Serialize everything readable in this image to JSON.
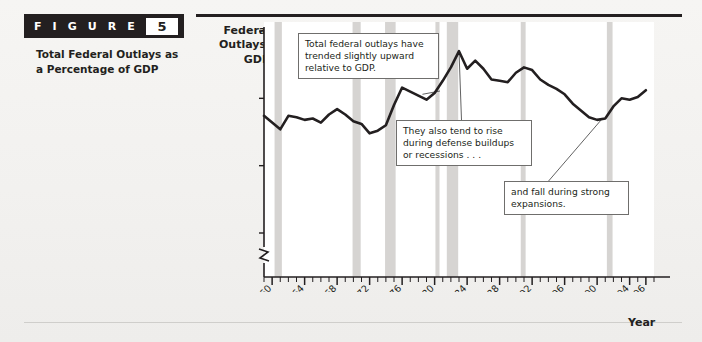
{
  "figure": {
    "tag_word": "F I G U R E",
    "number": "5",
    "caption": "Total Federal Outlays as a Percentage of GDP"
  },
  "axes": {
    "y_title": "Federal Outlays/ GDP",
    "x_title": "Year"
  },
  "callouts": {
    "c1": "Total federal outlays have trended slightly upward relative to GDP.",
    "c2": "They also tend to rise during defense buildups or recessions . . .",
    "c3": "and fall during strong expansions."
  },
  "colors": {
    "line": "#231f20",
    "recession_band": "#d6d4d2",
    "plot_bg": "#ffffff",
    "axis": "#231f20",
    "header_bar": "#231f20",
    "page_bg": "#f2f1ef"
  },
  "chart_data": {
    "type": "line",
    "title": "Total Federal Outlays as a Percentage of GDP",
    "xlabel": "Year",
    "ylabel": "Federal Outlays/GDP",
    "xlim": [
      1959,
      2007
    ],
    "ylim": [
      8.5,
      25
    ],
    "y_axis_break": true,
    "grid": false,
    "legend": false,
    "y_ticks": [
      10,
      15,
      20,
      25
    ],
    "y_tick_labels": [
      "10%",
      "15%",
      "20%",
      "25%"
    ],
    "x_ticks": [
      1960,
      1964,
      1968,
      1972,
      1976,
      1980,
      1984,
      1988,
      1992,
      1996,
      2000,
      2004,
      2006
    ],
    "x_tick_labels": [
      "1960",
      "1964",
      "1968",
      "1972",
      "1976",
      "1980",
      "1984",
      "1988",
      "1992",
      "1996",
      "2000",
      "2004",
      "2006"
    ],
    "x_minor_tick_interval": 1,
    "x": [
      1959,
      1960,
      1961,
      1962,
      1963,
      1964,
      1965,
      1966,
      1967,
      1968,
      1969,
      1970,
      1971,
      1972,
      1973,
      1974,
      1975,
      1976,
      1977,
      1978,
      1979,
      1980,
      1981,
      1982,
      1983,
      1984,
      1985,
      1986,
      1987,
      1988,
      1989,
      1990,
      1991,
      1992,
      1993,
      1994,
      1995,
      1996,
      1997,
      1998,
      1999,
      2000,
      2001,
      2002,
      2003,
      2004,
      2005,
      2006
    ],
    "values": [
      18.7,
      18.2,
      17.7,
      18.7,
      18.6,
      18.4,
      18.5,
      18.2,
      18.8,
      19.2,
      18.8,
      18.3,
      18.1,
      17.4,
      17.6,
      18.0,
      19.5,
      20.8,
      20.5,
      20.2,
      19.9,
      20.4,
      21.3,
      22.3,
      23.5,
      22.2,
      22.8,
      22.2,
      21.4,
      21.3,
      21.2,
      21.9,
      22.3,
      22.1,
      21.4,
      21.0,
      20.7,
      20.3,
      19.6,
      19.1,
      18.6,
      18.4,
      18.5,
      19.4,
      20.0,
      19.9,
      20.1,
      20.6
    ],
    "recession_bands": [
      {
        "start": 1960.3,
        "end": 1961.2
      },
      {
        "start": 1969.9,
        "end": 1970.9
      },
      {
        "start": 1973.9,
        "end": 1975.2
      },
      {
        "start": 1980.1,
        "end": 1980.6
      },
      {
        "start": 1981.5,
        "end": 1982.9
      },
      {
        "start": 1990.6,
        "end": 1991.2
      },
      {
        "start": 2001.2,
        "end": 2001.9
      }
    ],
    "annotations": [
      {
        "text": "Total federal outlays have trended slightly upward relative to GDP.",
        "leader_to": {
          "x": 1978.5,
          "y": 20.3
        }
      },
      {
        "text": "They also tend to rise during defense buildups or recessions . . .",
        "leader_to": {
          "x": 1983.0,
          "y": 23.5
        }
      },
      {
        "text": "and fall during strong expansions.",
        "leader_to": {
          "x": 2000.5,
          "y": 18.4
        }
      }
    ]
  }
}
